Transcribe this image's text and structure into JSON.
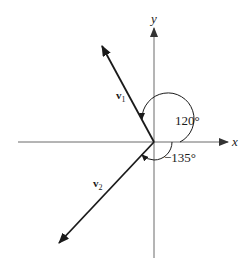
{
  "diagram": {
    "type": "vector-angle-diagram",
    "axes": {
      "x_label": "x",
      "y_label": "y"
    },
    "vectors": [
      {
        "name": "v1",
        "label_main": "v",
        "label_sub": "1",
        "angle_deg": 120
      },
      {
        "name": "v2",
        "label_main": "v",
        "label_sub": "2",
        "angle_deg": -135
      }
    ],
    "angles": [
      {
        "label": "120°",
        "for": "v1"
      },
      {
        "label": "−135°",
        "for": "v2"
      }
    ],
    "colors": {
      "axis": "#6a6a6a",
      "vector": "#1a1a1a",
      "text": "#1a1a1a",
      "background": "#ffffff"
    }
  }
}
